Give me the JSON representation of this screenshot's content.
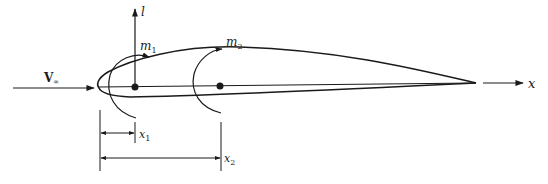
{
  "diagram": {
    "type": "airfoil-moment-diagram",
    "labels": {
      "freestream": "V",
      "freestream_sub": "∞",
      "lift": "l",
      "moment1": "m",
      "moment1_sub": "1",
      "moment2": "m",
      "moment2_sub": "2",
      "axis": "x",
      "dist1": "x",
      "dist1_sub": "1",
      "dist2": "x",
      "dist2_sub": "2"
    },
    "colors": {
      "stroke": "#1a1a1a",
      "background": "#ffffff"
    },
    "elements": [
      "freestream-arrow",
      "airfoil",
      "lift-arrow",
      "moment-arc-1",
      "moment-arc-2",
      "point-1",
      "point-2",
      "x-axis-arrow",
      "dimension-x1",
      "dimension-x2"
    ]
  }
}
